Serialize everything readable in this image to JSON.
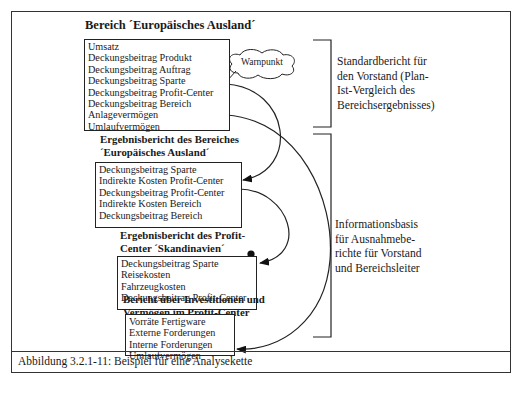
{
  "figure": {
    "caption": "Abbildung 3.2.1-11: Beispiel für eine Analysekette"
  },
  "reports": [
    {
      "title": "Bereich ´Europäisches Ausland´",
      "items": [
        "Umsatz",
        "Deckungsbeitrag Produkt",
        "Deckungsbeitrag Auftrag",
        "Deckungsbeitrag Sparte",
        "Deckungsbeitrag Profit-Center",
        "Deckungsbeitrag Bereich",
        "Anlagevermögen",
        "Umlaufvermögen"
      ],
      "marked_items": [
        "Deckungsbeitrag Profit-Center",
        "Deckungsbeitrag Bereich",
        "Umlaufvermögen"
      ]
    },
    {
      "title_line1": "Ergebnisbericht des Bereiches",
      "title_line2": "´Europäisches Ausland´",
      "items": [
        "Deckungsbeitrag Sparte",
        "Indirekte Kosten Profit-Center",
        "Deckungsbeitrag Profit-Center",
        "Indirekte Kosten Bereich",
        "Deckungsbeitrag Bereich"
      ],
      "marked_items": [
        "Indirekte Kosten Profit-Center",
        "Indirekte Kosten Bereich"
      ]
    },
    {
      "title_line1": "Ergebnisbericht des Profit-",
      "title_line2": "Center ´Skandinavien´",
      "items": [
        "Deckungsbeitrag Sparte",
        "Reisekosten",
        "Fahrzeugkosten",
        "Deckungsbeitrag Profit-Center"
      ],
      "marked_items": [
        "Reisekosten",
        "Fahrzeugkosten"
      ]
    },
    {
      "title_line1": "Bericht über Investitionen und",
      "title_line2": "Vermögen  im Profit-Center",
      "items": [
        "Vorräte Fertigware",
        "Externe Forderungen",
        "Interne Forderungen",
        "Umlaufvermögen"
      ],
      "marked_items": [
        "Vorräte Fertigware",
        "Externe Forderungen"
      ]
    }
  ],
  "callout": {
    "label": "Warnpunkt"
  },
  "brackets": [
    {
      "lines": [
        "Standardbericht für",
        "den Vorstand (Plan-",
        "Ist-Vergleich des",
        "Bereichsergebnisses)"
      ]
    },
    {
      "lines": [
        "Informationsbasis",
        "für Ausnahmebe-",
        "richte für Vorstand",
        "und Bereichsleiter"
      ]
    }
  ],
  "arrows": [
    {
      "from": "Deckungsbeitrag Profit-Center (Bereich)",
      "to": "Deckungsbeitrag Profit-Center (Ergebnisbericht Bereich)"
    },
    {
      "from": "Umlaufvermögen (Bereich)",
      "to": "Umlaufvermögen (Investitionen und Vermögen)"
    },
    {
      "from": "Indirekte Kosten Bereich",
      "to": "Fahrzeugkosten (Profit-Center Skandinavien)"
    }
  ]
}
